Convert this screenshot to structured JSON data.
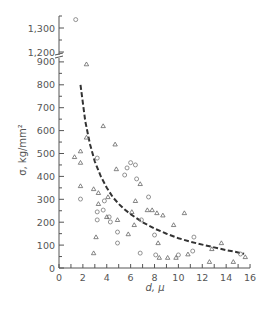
{
  "chart_data": {
    "type": "scatter",
    "title": "",
    "xlabel": "d, μ",
    "ylabel": "σ, kg/mm²",
    "xlim": [
      0,
      16
    ],
    "ylim": [
      0,
      1350
    ],
    "y_axis_break": {
      "from": 900,
      "to": 1200
    },
    "grid": false,
    "legend": "none",
    "x_ticks": [
      "0",
      "2",
      "4",
      "6",
      "8",
      "10",
      "12",
      "14",
      "16"
    ],
    "y_ticks_lower": [
      "0",
      "100",
      "200",
      "300",
      "400",
      "500",
      "600",
      "700",
      "800",
      "900"
    ],
    "y_ticks_upper": [
      "1,200",
      "1,300"
    ],
    "series": [
      {
        "name": "circles",
        "marker": "circle",
        "points": [
          [
            1.4,
            1335
          ],
          [
            3.2,
            480
          ],
          [
            6.0,
            460
          ],
          [
            5.7,
            437
          ],
          [
            6.4,
            450
          ],
          [
            5.5,
            406
          ],
          [
            6.5,
            389
          ],
          [
            1.8,
            301
          ],
          [
            3.8,
            293
          ],
          [
            3.2,
            245
          ],
          [
            3.7,
            253
          ],
          [
            4.2,
            223
          ],
          [
            4.3,
            201
          ],
          [
            3.2,
            210
          ],
          [
            4.9,
            157
          ],
          [
            4.9,
            109
          ],
          [
            6.9,
            210
          ],
          [
            6.8,
            65
          ],
          [
            8.1,
            57
          ],
          [
            7.5,
            310
          ],
          [
            8.0,
            144
          ],
          [
            10.0,
            57
          ],
          [
            11.3,
            135
          ],
          [
            11.2,
            74
          ],
          [
            15.2,
            61
          ]
        ]
      },
      {
        "name": "triangles",
        "marker": "triangle",
        "points": [
          [
            2.3,
            890
          ],
          [
            1.3,
            485
          ],
          [
            1.8,
            510
          ],
          [
            1.8,
            460
          ],
          [
            2.3,
            570
          ],
          [
            3.7,
            620
          ],
          [
            4.7,
            540
          ],
          [
            4.8,
            432
          ],
          [
            1.8,
            358
          ],
          [
            2.9,
            345
          ],
          [
            3.3,
            328
          ],
          [
            3.3,
            280
          ],
          [
            4.1,
            310
          ],
          [
            4.0,
            223
          ],
          [
            4.9,
            210
          ],
          [
            3.1,
            135
          ],
          [
            2.9,
            65
          ],
          [
            5.8,
            148
          ],
          [
            6.1,
            245
          ],
          [
            6.4,
            293
          ],
          [
            6.3,
            188
          ],
          [
            7.4,
            253
          ],
          [
            8.2,
            240
          ],
          [
            8.7,
            230
          ],
          [
            6.8,
            367
          ],
          [
            7.8,
            253
          ],
          [
            8.3,
            109
          ],
          [
            8.4,
            45
          ],
          [
            9.1,
            45
          ],
          [
            10.5,
            240
          ],
          [
            9.8,
            45
          ],
          [
            10.8,
            60
          ],
          [
            12.6,
            27
          ],
          [
            13.6,
            109
          ],
          [
            14.6,
            27
          ],
          [
            15.6,
            48
          ],
          [
            9.6,
            188
          ],
          [
            12.8,
            83
          ]
        ]
      },
      {
        "name": "fit",
        "marker": "dashed-line",
        "points": [
          [
            1.8,
            800
          ],
          [
            2.2,
            640
          ],
          [
            2.6,
            540
          ],
          [
            3.0,
            465
          ],
          [
            3.5,
            400
          ],
          [
            4.0,
            350
          ],
          [
            4.5,
            310
          ],
          [
            5.0,
            280
          ],
          [
            5.5,
            255
          ],
          [
            6.0,
            235
          ],
          [
            7.0,
            200
          ],
          [
            8.0,
            172
          ],
          [
            9.0,
            150
          ],
          [
            10.0,
            130
          ],
          [
            11.0,
            115
          ],
          [
            12.0,
            102
          ],
          [
            13.0,
            90
          ],
          [
            14.0,
            78
          ],
          [
            15.0,
            68
          ],
          [
            15.5,
            62
          ]
        ]
      }
    ]
  }
}
